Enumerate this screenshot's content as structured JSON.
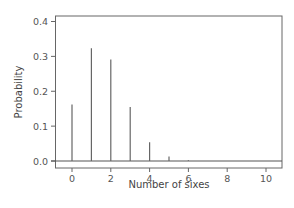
{
  "chart_data": {
    "type": "bar",
    "subtype": "stem/needle plot",
    "title": "",
    "xlabel": "Number of sixes",
    "ylabel": "Probability",
    "x": [
      0,
      1,
      2,
      3,
      4,
      5,
      6,
      7,
      8,
      9,
      10
    ],
    "values": [
      0.162,
      0.323,
      0.291,
      0.155,
      0.054,
      0.013,
      0.002,
      0.0002,
      2e-05,
      1e-06,
      2e-08
    ],
    "xlim": [
      -0.8,
      10.8
    ],
    "ylim": [
      -0.02,
      0.42
    ],
    "xticks": [
      0,
      2,
      4,
      6,
      8,
      10
    ],
    "xtick_labels": [
      "0",
      "2",
      "4",
      "6",
      "8",
      "10"
    ],
    "yticks": [
      0.0,
      0.1,
      0.2,
      0.3,
      0.4
    ],
    "ytick_labels": [
      "0.0",
      "0.1",
      "0.2",
      "0.3",
      "0.4"
    ],
    "grid": false,
    "legend": null,
    "baseline": 0.0,
    "colors": {
      "line": "#666666",
      "frame": "#555555",
      "text": "#555555"
    }
  }
}
